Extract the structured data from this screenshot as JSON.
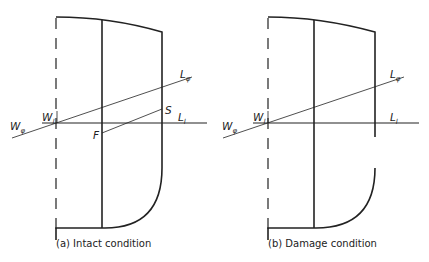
{
  "panels": [
    {
      "id": "a",
      "caption": "(a) Intact condition",
      "labels": {
        "W_phi": "W",
        "W_phi_sub": "φ",
        "W_l": "W",
        "W_l_sub": "l",
        "L_phi": "L",
        "L_phi_sub": "φ",
        "L_l": "L",
        "L_l_sub": "l",
        "F": "F",
        "S": "S"
      }
    },
    {
      "id": "b",
      "caption": "(b) Damage condition",
      "labels": {
        "W_phi": "W",
        "W_phi_sub": "φ",
        "W_l": "W",
        "W_l_sub": "l",
        "L_phi": "L",
        "L_phi_sub": "φ",
        "L_l": "L",
        "L_l_sub": "l"
      }
    }
  ]
}
